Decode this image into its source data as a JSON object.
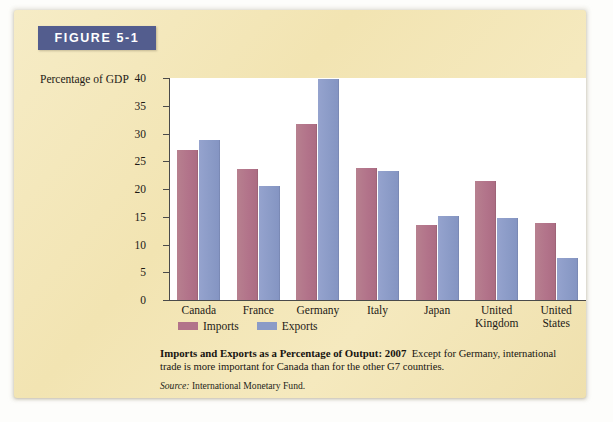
{
  "figure": {
    "banner_label": "FIGURE 5-1",
    "banner_color": "#535d8e",
    "card_color": "#f4e6b8"
  },
  "caption": {
    "title": "Imports and Exports as a Percentage of Output: 2007",
    "body": "Except for Germany, international trade is more important for Canada than for the other G7 countries.",
    "source_word": "Source:",
    "source_text": "International Monetary Fund."
  },
  "legend": {
    "position": "below-axis",
    "items": [
      {
        "label": "Imports",
        "color": "#b2738a"
      },
      {
        "label": "Exports",
        "color": "#8b9bc7"
      }
    ]
  },
  "chart_data": {
    "type": "bar",
    "title": "Imports and Exports as a Percentage of Output: 2007",
    "xlabel": "",
    "ylabel": "Percentage of GDP",
    "ylim": [
      0,
      40
    ],
    "yticks": [
      0,
      5,
      10,
      15,
      20,
      25,
      30,
      35,
      40
    ],
    "ytick_labels": [
      "0",
      "5",
      "10",
      "15",
      "20",
      "25",
      "30",
      "35",
      "40"
    ],
    "grid": false,
    "categories": [
      "Canada",
      "France",
      "Germany",
      "Italy",
      "Japan",
      "United Kingdom",
      "United States"
    ],
    "category_lines": [
      [
        "Canada"
      ],
      [
        "France"
      ],
      [
        "Germany"
      ],
      [
        "Italy"
      ],
      [
        "Japan"
      ],
      [
        "United",
        "Kingdom"
      ],
      [
        "United",
        "States"
      ]
    ],
    "series": [
      {
        "name": "Imports",
        "color": "#b2738a",
        "values": [
          27.0,
          23.6,
          31.7,
          23.8,
          13.5,
          21.5,
          13.8
        ]
      },
      {
        "name": "Exports",
        "color": "#8b9bc7",
        "values": [
          28.8,
          20.6,
          39.8,
          23.3,
          15.2,
          14.7,
          7.5
        ]
      }
    ]
  }
}
